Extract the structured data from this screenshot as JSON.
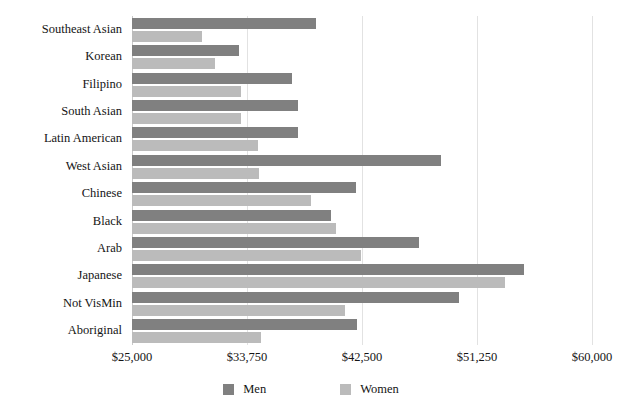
{
  "chart_data": {
    "type": "bar",
    "orientation": "horizontal",
    "title": "",
    "subtitle": "",
    "xlabel": "",
    "ylabel": "",
    "grid": true,
    "legend_position": "bottom-center",
    "xlim": [
      25000,
      60000
    ],
    "xticks": [
      "$25,000",
      "$33,750",
      "$42,500",
      "$51,250",
      "$60,000"
    ],
    "xtick_values": [
      25000,
      33750,
      42500,
      51250,
      60000
    ],
    "categories": [
      "Southeast Asian",
      "Korean",
      "Filipino",
      "South Asian",
      "Latin American",
      "West Asian",
      "Chinese",
      "Black",
      "Arab",
      "Japanese",
      "Not VisMin",
      "Aboriginal"
    ],
    "series": [
      {
        "name": "Men",
        "color": "#808080",
        "values": [
          39000,
          33150,
          37200,
          37650,
          37650,
          48500,
          42050,
          40150,
          46850,
          54800,
          49900,
          42100
        ]
      },
      {
        "name": "Women",
        "color": "#bbbbbb",
        "values": [
          30300,
          31300,
          33300,
          33300,
          34600,
          34700,
          38600,
          40500,
          42400,
          53400,
          41200,
          34800
        ]
      }
    ]
  },
  "legend": {
    "items": [
      {
        "label": "Men",
        "color": "#808080"
      },
      {
        "label": "Women",
        "color": "#bbbbbb"
      }
    ]
  }
}
